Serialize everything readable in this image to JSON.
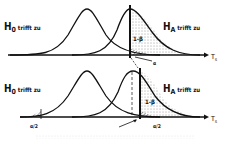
{
  "panels": [
    {
      "h0_label": "H",
      "h0_sub": "0",
      "h0_suffix": " trifft zu",
      "ha_label": "H",
      "ha_sub": "A",
      "ha_suffix": " trifft zu",
      "power_label": "1-β",
      "alpha_label": "α",
      "axis_label": "T",
      "axis_sub": "s"
    },
    {
      "h0_label": "H",
      "h0_sub": "0",
      "h0_suffix": " trifft zu",
      "ha_label": "H",
      "ha_sub": "A",
      "ha_suffix": " trifft zu",
      "power_label": "1-β",
      "alpha_left_label": "α/2",
      "alpha_right_label": "α/2",
      "axis_label": "T",
      "axis_sub": "s"
    }
  ]
}
